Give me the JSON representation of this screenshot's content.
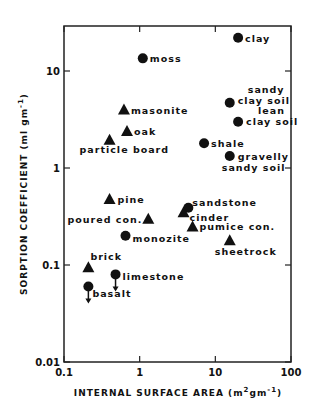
{
  "chart_data": {
    "type": "scatter",
    "title": "",
    "xlabel": "INTERNAL SURFACE AREA (m²gm⁻¹)",
    "ylabel": "SORPTION COEFFICIENT (ml gm⁻¹)",
    "xscale": "log",
    "yscale": "log",
    "xlim": [
      0.1,
      100
    ],
    "ylim": [
      0.01,
      30
    ],
    "grid": false,
    "legend": null,
    "x_ticks": [
      "0.1",
      "1",
      "10",
      "100"
    ],
    "y_ticks": [
      "0.01",
      "0.1",
      "1",
      "10"
    ],
    "marker_legend": {
      "circle": "natural/mineral material",
      "triangle": "building/organic material"
    },
    "points": [
      {
        "label": "clay",
        "x": 20,
        "y": 22,
        "marker": "circle"
      },
      {
        "label": "moss",
        "x": 1.1,
        "y": 13.5,
        "marker": "circle"
      },
      {
        "label": "masonite",
        "x": 0.62,
        "y": 4.0,
        "marker": "triangle"
      },
      {
        "label": "oak",
        "x": 0.68,
        "y": 2.4,
        "marker": "triangle"
      },
      {
        "label": "particle board",
        "x": 0.4,
        "y": 1.95,
        "marker": "triangle"
      },
      {
        "label": "sandy clay soil",
        "x": 15.5,
        "y": 4.7,
        "marker": "circle"
      },
      {
        "label": "lean clay soil",
        "x": 20,
        "y": 3.0,
        "marker": "circle"
      },
      {
        "label": "shale",
        "x": 7.1,
        "y": 1.8,
        "marker": "circle"
      },
      {
        "label": "gravelly sandy soil",
        "x": 15.5,
        "y": 1.33,
        "marker": "circle"
      },
      {
        "label": "pine",
        "x": 0.4,
        "y": 0.48,
        "marker": "triangle"
      },
      {
        "label": "poured con.",
        "x": 1.3,
        "y": 0.3,
        "marker": "triangle"
      },
      {
        "label": "monozite",
        "x": 0.65,
        "y": 0.2,
        "marker": "circle"
      },
      {
        "label": "sandstone",
        "x": 4.4,
        "y": 0.39,
        "marker": "circle"
      },
      {
        "label": "cinder",
        "x": 3.8,
        "y": 0.35,
        "marker": "triangle"
      },
      {
        "label": "pumice con.",
        "x": 5.0,
        "y": 0.25,
        "marker": "triangle"
      },
      {
        "label": "sheetrock",
        "x": 15.5,
        "y": 0.18,
        "marker": "triangle"
      },
      {
        "label": "brick",
        "x": 0.21,
        "y": 0.095,
        "marker": "triangle"
      },
      {
        "label": "limestone",
        "x": 0.48,
        "y": 0.08,
        "marker": "circle",
        "upper_limit": true
      },
      {
        "label": "basalt",
        "x": 0.21,
        "y": 0.06,
        "marker": "circle",
        "upper_limit": true
      }
    ]
  },
  "axes": {
    "x_title_main": "INTERNAL SURFACE AREA (m",
    "x_title_sup1": "2",
    "x_title_mid": "gm",
    "x_title_sup2": "-1",
    "x_title_end": ")",
    "y_title_main": "SORPTION COEFFICIENT (ml gm",
    "y_title_sup": "-1",
    "y_title_end": ")"
  },
  "colors": {
    "ink": "#111111",
    "background": "#ffffff"
  }
}
